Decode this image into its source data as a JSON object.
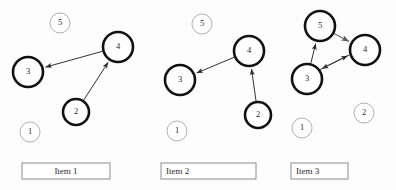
{
  "canvas": {
    "width": 396,
    "height": 190,
    "background": "#fdfdfd"
  },
  "colors": {
    "node_stroke_active": "#111111",
    "node_stroke_inactive": "#a8a8a8",
    "edge_stroke": "#333333",
    "edge_stroke_gray": "#6f6f6f",
    "box_stroke": "#8c8c8c",
    "text": "#2a2a2a"
  },
  "panels": [
    {
      "id": "panel-1",
      "caption": "Item 1",
      "caption_align": "center",
      "box": {
        "x": 22,
        "y": 163,
        "width": 88,
        "height": 16
      },
      "nodes": [
        {
          "id": "n5",
          "label": "5",
          "cx": 60,
          "cy": 23,
          "r": 10,
          "style": "thin"
        },
        {
          "id": "n4",
          "label": "4",
          "cx": 118,
          "cy": 47,
          "r": 15,
          "style": "bold"
        },
        {
          "id": "n3",
          "label": "3",
          "cx": 28,
          "cy": 72,
          "r": 15,
          "style": "bold"
        },
        {
          "id": "n2",
          "label": "2",
          "cx": 76,
          "cy": 112,
          "r": 13,
          "style": "bold"
        },
        {
          "id": "n1",
          "label": "1",
          "cx": 30,
          "cy": 132,
          "r": 10,
          "style": "thin"
        }
      ],
      "edges": [
        {
          "from": "n4",
          "to": "n3",
          "style": "dark",
          "offset": 0
        },
        {
          "from": "n2",
          "to": "n4",
          "style": "dark",
          "offset": 0
        }
      ]
    },
    {
      "id": "panel-2",
      "caption": "Item 2",
      "caption_align": "left",
      "box": {
        "x": 161,
        "y": 163,
        "width": 95,
        "height": 16
      },
      "nodes": [
        {
          "id": "n5",
          "label": "5",
          "cx": 202,
          "cy": 24,
          "r": 10,
          "style": "thin"
        },
        {
          "id": "n4",
          "label": "4",
          "cx": 249,
          "cy": 51,
          "r": 15,
          "style": "bold"
        },
        {
          "id": "n3",
          "label": "3",
          "cx": 180,
          "cy": 80,
          "r": 15,
          "style": "bold"
        },
        {
          "id": "n2",
          "label": "2",
          "cx": 258,
          "cy": 115,
          "r": 13,
          "style": "bold"
        },
        {
          "id": "n1",
          "label": "1",
          "cx": 177,
          "cy": 131,
          "r": 10,
          "style": "thin"
        }
      ],
      "edges": [
        {
          "from": "n4",
          "to": "n3",
          "style": "dark",
          "offset": 0
        },
        {
          "from": "n2",
          "to": "n4",
          "style": "dark",
          "offset": 0
        }
      ]
    },
    {
      "id": "panel-3",
      "caption": "Item 3",
      "caption_align": "left",
      "box": {
        "x": 291,
        "y": 163,
        "width": 57,
        "height": 16
      },
      "nodes": [
        {
          "id": "n5",
          "label": "5",
          "cx": 320,
          "cy": 26,
          "r": 15,
          "style": "bold"
        },
        {
          "id": "n4",
          "label": "4",
          "cx": 365,
          "cy": 50,
          "r": 15,
          "style": "bold"
        },
        {
          "id": "n3",
          "label": "3",
          "cx": 307,
          "cy": 79,
          "r": 15,
          "style": "bold"
        },
        {
          "id": "n2",
          "label": "2",
          "cx": 364,
          "cy": 113,
          "r": 10,
          "style": "thin"
        },
        {
          "id": "n1",
          "label": "1",
          "cx": 302,
          "cy": 128,
          "r": 10,
          "style": "thin"
        }
      ],
      "edges": [
        {
          "from": "n5",
          "to": "n4",
          "style": "gray",
          "offset": 0
        },
        {
          "from": "n3",
          "to": "n5",
          "style": "dark",
          "offset": 0
        },
        {
          "from": "n4",
          "to": "n3",
          "style": "dark",
          "offset": 2.6
        },
        {
          "from": "n3",
          "to": "n4",
          "style": "dark",
          "offset": -2.6
        }
      ]
    }
  ]
}
